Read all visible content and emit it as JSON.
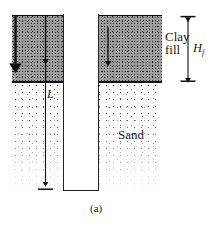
{
  "figure": {
    "caption": "(a)",
    "layers": [
      {
        "id": "clay",
        "label_line1": "Clay",
        "label_line2": "fill",
        "color": "#9d9d9d"
      },
      {
        "id": "sand",
        "label": "Sand",
        "color": "#ffffff"
      }
    ],
    "dimensions": [
      {
        "id": "Hf",
        "symbol": "H",
        "subscript": "f",
        "describes": "clay fill thickness"
      },
      {
        "id": "L",
        "symbol": "L",
        "subscript": "",
        "describes": "pile embedded length"
      },
      {
        "id": "z",
        "symbol": "z",
        "subscript": "",
        "describes": "depth coordinate"
      }
    ],
    "elements": {
      "pile_name": "pile",
      "downdrag_arrows": 3,
      "ground_line": "ground surface",
      "interface_line": "clay-sand interface"
    },
    "colors": {
      "ink": "#111111",
      "clay_fill": "#9d9d9d",
      "pile_fill": "#ffffff"
    }
  }
}
